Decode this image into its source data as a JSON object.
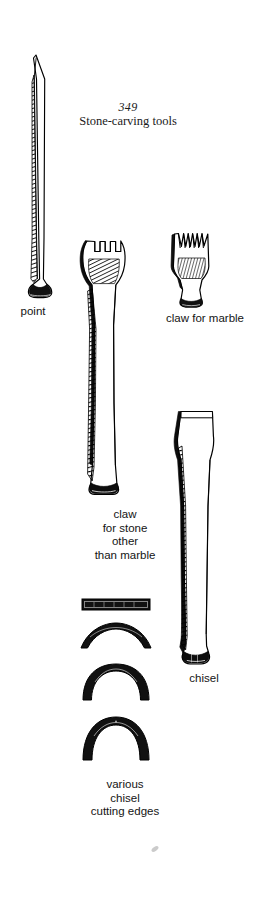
{
  "figure": {
    "number": "349",
    "caption": "Stone-carving tools",
    "background_color": "#ffffff",
    "ink_color": "#000000"
  },
  "tools": [
    {
      "id": "point",
      "label": "point",
      "label_lines": [
        "point"
      ],
      "description": "long tapered steel point with pointed tip and mushroomed struck head"
    },
    {
      "id": "claw-for-marble",
      "label": "claw for marble",
      "label_lines": [
        "claw for marble"
      ],
      "teeth": 5,
      "tooth_shape": "pointed-v",
      "description": "short claw chisel with five sharp V teeth"
    },
    {
      "id": "claw-for-stone-other-than-marble",
      "label": "claw\nfor stone\nother\nthan marble",
      "label_lines": [
        "claw",
        "for stone",
        "other",
        "than marble"
      ],
      "teeth": 4,
      "tooth_shape": "square",
      "description": "long claw chisel with square teeth for stone other than marble"
    },
    {
      "id": "chisel",
      "label": "chisel",
      "label_lines": [
        "chisel"
      ],
      "description": "flat-edged chisel with tapering shaft"
    }
  ],
  "cutting_edges": {
    "label": "various\nchisel\ncutting edges",
    "label_lines": [
      "various",
      "chisel",
      "cutting edges"
    ],
    "profiles": [
      {
        "id": "flat-edge",
        "shape": "straight bar"
      },
      {
        "id": "shallow-curve-edge",
        "shape": "shallow arc"
      },
      {
        "id": "deep-gouge-edge",
        "shape": "deep U / horseshoe"
      },
      {
        "id": "round-gouge-edge",
        "shape": "round horseshoe"
      }
    ]
  },
  "artifacts": {
    "smudge": "small grey scan smudge"
  }
}
